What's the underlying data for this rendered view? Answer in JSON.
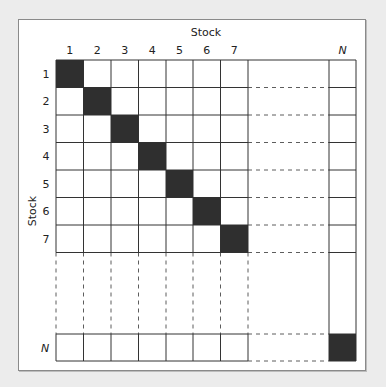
{
  "diagram": {
    "type": "covariance-matrix-grid",
    "top_axis_label": "Stock",
    "left_axis_label": "Stock",
    "column_labels": [
      "1",
      "2",
      "3",
      "4",
      "5",
      "6",
      "7",
      "N"
    ],
    "row_labels": [
      "1",
      "2",
      "3",
      "4",
      "5",
      "6",
      "7",
      "N"
    ],
    "diagonal_filled": true,
    "fill_color": "#2f2f2f",
    "line_color": "#333333"
  }
}
